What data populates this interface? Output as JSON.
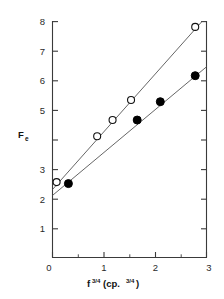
{
  "chart_data": {
    "type": "scatter",
    "title": "",
    "xlabel": "f 3/4(cp.3/4)",
    "xlabel_parts": {
      "base": "f",
      "exponent": "3/4",
      "paren_open": "(cp.",
      "paren_exponent": "3/4",
      "paren_close": ")"
    },
    "ylabel": "Fe",
    "ylabel_parts": {
      "base": "F",
      "subscript": "e"
    },
    "xlim": [
      0,
      3
    ],
    "ylim": [
      0,
      8
    ],
    "xticks": [
      0,
      1,
      2,
      3
    ],
    "yticks": [
      1,
      2,
      3,
      4,
      5,
      6,
      7,
      8
    ],
    "xtick_labels": [
      "0",
      "1",
      "2",
      "3"
    ],
    "ytick_labels": [
      "1",
      "2",
      "3",
      "4",
      "5",
      "6",
      "7",
      "8"
    ],
    "ytick_labels_shown": [
      "1",
      "2",
      "3",
      "5",
      "6",
      "7",
      "8"
    ],
    "x_minor_ticks": [
      0.5,
      1.5,
      2.5
    ],
    "grid": false,
    "legend": "none",
    "marker_colors": {
      "open": "#ffffff",
      "open_edge": "#111111",
      "filled": "#000000"
    },
    "axis_color": "#3a3a3a",
    "fit_line_color": "#555555",
    "series": [
      {
        "name": "open-circles",
        "marker": "open-circle",
        "points": [
          {
            "x": 0.08,
            "y": 2.55
          },
          {
            "x": 0.87,
            "y": 4.1
          },
          {
            "x": 1.17,
            "y": 4.65
          },
          {
            "x": 1.53,
            "y": 5.33
          },
          {
            "x": 2.78,
            "y": 7.8
          }
        ],
        "fit": {
          "x0": 0.0,
          "y0": 2.3,
          "x1": 2.92,
          "y1": 8.0
        }
      },
      {
        "name": "filled-circles",
        "marker": "filled-circle",
        "points": [
          {
            "x": 0.31,
            "y": 2.5
          },
          {
            "x": 1.65,
            "y": 4.65
          },
          {
            "x": 2.1,
            "y": 5.27
          },
          {
            "x": 2.78,
            "y": 6.15
          }
        ],
        "fit": {
          "x0": 0.0,
          "y0": 2.1,
          "x1": 3.0,
          "y1": 6.45
        }
      }
    ]
  }
}
